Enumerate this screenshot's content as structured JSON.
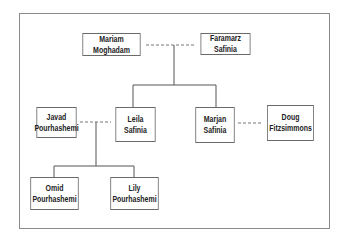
{
  "diagram": {
    "type": "family-tree",
    "people": {
      "mariam": {
        "line1": "Mariam Moghadam",
        "line2": ""
      },
      "faramarz": {
        "line1": "Faramarz Safinia",
        "line2": ""
      },
      "javad": {
        "line1": "Javad",
        "line2": "Pourhashemi"
      },
      "leila": {
        "line1": "Leila Safinia",
        "line2": ""
      },
      "marjan": {
        "line1": "Marjan",
        "line2": "Safinia"
      },
      "doug": {
        "line1": "Doug",
        "line2": "Fitzsimmons"
      },
      "omid": {
        "line1": "Omid",
        "line2": "Pourhashemi"
      },
      "lily": {
        "line1": "Lily",
        "line2": "Pourhashemi"
      }
    },
    "relationships": [
      {
        "type": "partner",
        "from": "Mariam Moghadam",
        "to": "Faramarz Safinia",
        "style": "dashed"
      },
      {
        "type": "partner",
        "from": "Javad Pourhashemi",
        "to": "Leila Safinia",
        "style": "dashed"
      },
      {
        "type": "partner",
        "from": "Marjan Safinia",
        "to": "Doug Fitzsimmons",
        "style": "dashed"
      },
      {
        "type": "children",
        "parents": [
          "Mariam Moghadam",
          "Faramarz Safinia"
        ],
        "children": [
          "Leila Safinia",
          "Marjan Safinia"
        ]
      },
      {
        "type": "children",
        "parents": [
          "Javad Pourhashemi",
          "Leila Safinia"
        ],
        "children": [
          "Omid Pourhashemi",
          "Lily Pourhashemi"
        ]
      }
    ]
  }
}
